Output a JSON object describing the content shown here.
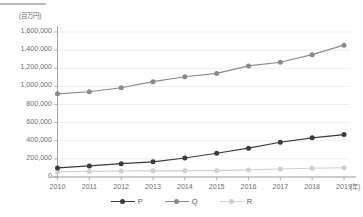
{
  "chart_data": {
    "type": "line",
    "title": "",
    "subtitle": "",
    "xlabel": "(年)",
    "ylabel": "(百万円)",
    "x": [
      2010,
      2011,
      2012,
      2013,
      2014,
      2015,
      2016,
      2017,
      2018,
      2019
    ],
    "categories": [
      "2010",
      "2011",
      "2012",
      "2013",
      "2014",
      "2015",
      "2016",
      "2017",
      "2018",
      "2019"
    ],
    "xtick_labels": [
      "2010",
      "2011",
      "2012",
      "2013",
      "2014",
      "2015",
      "2016",
      "2017",
      "2018",
      "2019"
    ],
    "ytick_labels": [
      "0",
      "200,000",
      "400,000",
      "600,000",
      "800,000",
      "1,000,000",
      "1,200,000",
      "1,400,000",
      "1,600,000"
    ],
    "ytick_values": [
      0,
      200000,
      400000,
      600000,
      800000,
      1000000,
      1200000,
      1400000,
      1600000
    ],
    "ylim": [
      0,
      1600000
    ],
    "xlim": [
      2010,
      2019
    ],
    "grid": "horizontal",
    "legend_position": "bottom-center",
    "series": [
      {
        "name": "P",
        "color": "#3a3a3a",
        "marker": "circle",
        "values": [
          100000,
          122000,
          147000,
          167000,
          210000,
          262000,
          318000,
          383000,
          432000,
          468000
        ]
      },
      {
        "name": "Q",
        "color": "#8a8a8a",
        "marker": "circle",
        "values": [
          918000,
          941000,
          985000,
          1052000,
          1106000,
          1143000,
          1226000,
          1266000,
          1350000,
          1455000
        ]
      },
      {
        "name": "R",
        "color": "#cfcfcf",
        "marker": "circle",
        "values": [
          58000,
          62000,
          66000,
          68000,
          70000,
          70000,
          78000,
          88000,
          96000,
          102000
        ]
      }
    ],
    "annotations": []
  },
  "axes": {
    "y_unit_label": "(百万円)",
    "x_unit_label": "(年)"
  },
  "legend": {
    "items": [
      {
        "label": "P",
        "color": "#3a3a3a"
      },
      {
        "label": "Q",
        "color": "#8a8a8a"
      },
      {
        "label": "R",
        "color": "#cfcfcf"
      }
    ]
  },
  "colors": {
    "background": "#ffffff",
    "axis": "#9a9a9a",
    "gridline": "#eaeaea",
    "text": "#6e6e6e",
    "series_p": "#3a3a3a",
    "series_q": "#8a8a8a",
    "series_r": "#cfcfcf",
    "top_rule": "#b9b9b9"
  }
}
